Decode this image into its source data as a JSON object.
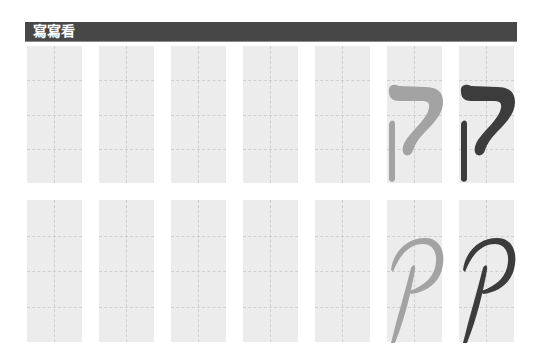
{
  "header": {
    "title": "寫寫看"
  },
  "practice": {
    "letter_name": "qof",
    "rows": [
      {
        "style": "print",
        "glyph": "ק",
        "boxes": [
          {
            "content": "empty"
          },
          {
            "content": "empty"
          },
          {
            "content": "empty"
          },
          {
            "content": "empty"
          },
          {
            "content": "empty"
          },
          {
            "content": "trace",
            "color": "#a3a3a3"
          },
          {
            "content": "model",
            "color": "#3c3c3c"
          }
        ]
      },
      {
        "style": "cursive",
        "glyph": "ק",
        "boxes": [
          {
            "content": "empty"
          },
          {
            "content": "empty"
          },
          {
            "content": "empty"
          },
          {
            "content": "empty"
          },
          {
            "content": "empty"
          },
          {
            "content": "trace",
            "color": "#a3a3a3"
          },
          {
            "content": "model",
            "color": "#3c3c3c"
          }
        ]
      }
    ]
  },
  "colors": {
    "header_bg": "#474747",
    "header_text": "#ffffff",
    "box_bg": "#ececec",
    "guide": "#cfcfcf",
    "trace": "#a3a3a3",
    "model": "#3c3c3c"
  }
}
